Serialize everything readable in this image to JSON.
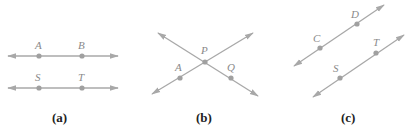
{
  "panels": [
    {
      "caption": "(a)",
      "lines": [
        {
          "points": [
            {
              "label": "A"
            },
            {
              "label": "B"
            }
          ]
        },
        {
          "points": [
            {
              "label": "S"
            },
            {
              "label": "T"
            }
          ]
        }
      ]
    },
    {
      "caption": "(b)",
      "lines": [
        {
          "points": [
            {
              "label": "A"
            },
            {
              "label": "P"
            }
          ]
        },
        {
          "points": [
            {
              "label": "P"
            },
            {
              "label": "Q"
            }
          ]
        }
      ],
      "intersection": "P"
    },
    {
      "caption": "(c)",
      "lines": [
        {
          "points": [
            {
              "label": "C"
            },
            {
              "label": "D"
            }
          ]
        },
        {
          "points": [
            {
              "label": "S"
            },
            {
              "label": "T"
            }
          ]
        }
      ]
    }
  ],
  "labels": {
    "a_A": "A",
    "a_B": "B",
    "a_S": "S",
    "a_T": "T",
    "b_P": "P",
    "b_A": "A",
    "b_Q": "Q",
    "c_C": "C",
    "c_D": "D",
    "c_S": "S",
    "c_T": "T"
  },
  "captions": {
    "a": "(a)",
    "b": "(b)",
    "c": "(c)"
  },
  "colors": {
    "line": "#a8a8a8",
    "point": "#a0a0a0",
    "label": "#8a8a8a",
    "caption": "#222222"
  }
}
